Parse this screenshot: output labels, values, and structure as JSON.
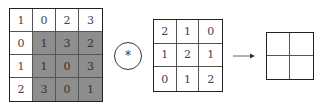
{
  "input_matrix": {
    "rows": [
      [
        "1",
        "0",
        "2",
        "3"
      ],
      [
        "0",
        "1",
        "3",
        "2"
      ],
      [
        "1",
        "1",
        "0",
        "3"
      ],
      [
        "2",
        "3",
        "0",
        "1"
      ]
    ],
    "shaded_cells": [
      [
        1,
        1
      ],
      [
        1,
        2
      ],
      [
        1,
        3
      ],
      [
        2,
        1
      ],
      [
        2,
        2
      ],
      [
        2,
        3
      ],
      [
        3,
        1
      ],
      [
        3,
        2
      ],
      [
        3,
        3
      ]
    ],
    "shade_color": "#8e8e8e"
  },
  "operator": {
    "symbol": "*",
    "icon": "convolution-operator-icon"
  },
  "kernel_matrix": {
    "rows": [
      [
        "2",
        "1",
        "0"
      ],
      [
        "1",
        "2",
        "1"
      ],
      [
        "0",
        "1",
        "2"
      ]
    ]
  },
  "arrow": {
    "icon": "right-arrow-icon"
  },
  "output_matrix": {
    "rows": [
      [
        "",
        ""
      ],
      [
        "",
        ""
      ]
    ]
  }
}
